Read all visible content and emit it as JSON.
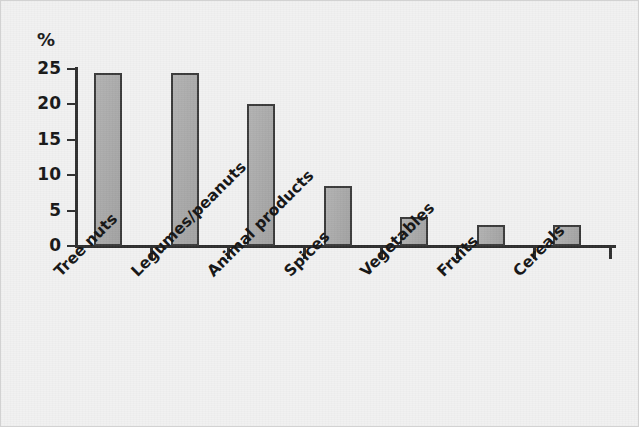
{
  "chart_data": {
    "type": "bar",
    "title": "",
    "subtitle": "",
    "xlabel": "",
    "ylabel": "%",
    "categories": [
      "Tree nuts",
      "Legumes/peanuts",
      "Animal products",
      "Spices",
      "Vegetables",
      "Fruits",
      "Cereals"
    ],
    "values": [
      24.5,
      24.5,
      20.0,
      8.5,
      4.1,
      2.9,
      2.9
    ],
    "ylim": [
      0,
      25
    ],
    "yticks": [
      0,
      5,
      10,
      15,
      20,
      25
    ],
    "ytick_labels": [
      "0",
      "5",
      "10",
      "15",
      "20",
      "25"
    ],
    "grid": false,
    "legend": null,
    "legend_position": "none",
    "annotations": [],
    "bar_fill": "#a9a9a9",
    "bar_border": "#3a3a3a",
    "axis_color": "#2e2e2e",
    "background": "#f1f1f1",
    "xtick_label_rotation": -45
  }
}
